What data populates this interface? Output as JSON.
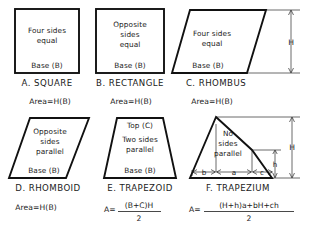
{
  "document": {
    "type": "geometry-reference-plate",
    "background_color": "#ffffff",
    "ink_color": "#111111"
  },
  "figures": [
    {
      "id": "square",
      "title": "A.  SQUARE",
      "shape": "square",
      "inner_lines": [
        "Four  sides",
        "equal"
      ],
      "base_label": "Base  (B)",
      "formula": "Area=H(B)",
      "dimension_labels": []
    },
    {
      "id": "rectangle",
      "title": "B.  RECTANGLE",
      "shape": "rectangle",
      "inner_lines": [
        "Opposite",
        "sides",
        "equal"
      ],
      "base_label": "Base  (B)",
      "formula": "Area=H(B)",
      "dimension_labels": []
    },
    {
      "id": "rhombus",
      "title": "C.  RHOMBUS",
      "shape": "rhombus",
      "inner_lines": [
        "Four  sides",
        "equal"
      ],
      "base_label": "Base  (B)",
      "formula": "Area=H(B)",
      "dimension_labels": [
        "H"
      ]
    },
    {
      "id": "rhomboid",
      "title": "D.  RHOMBOID",
      "shape": "rhomboid",
      "inner_lines": [
        "Opposite",
        "sides",
        "parallel"
      ],
      "base_label": "Base  (B)",
      "formula": "Area=H(B)",
      "dimension_labels": []
    },
    {
      "id": "trapezoid",
      "title": "E.  TRAPEZOID",
      "shape": "trapezoid",
      "top_label": "Top  (C)",
      "inner_lines": [
        "Two  sides",
        "parallel"
      ],
      "base_label": "Base  (B)",
      "formula_prefix": "A=",
      "formula_numerator": "(B+C)H",
      "formula_denominator": "2",
      "dimension_labels": []
    },
    {
      "id": "trapezium",
      "title": "F.  TRAPEZIUM",
      "shape": "trapezium",
      "inner_lines": [
        "No",
        "sides",
        "parallel"
      ],
      "formula_prefix": "A=",
      "formula_numerator": "(H+h)a+bH+ch",
      "formula_denominator": "2",
      "dimension_labels": [
        "b",
        "a",
        "c",
        "H",
        "h"
      ]
    }
  ]
}
